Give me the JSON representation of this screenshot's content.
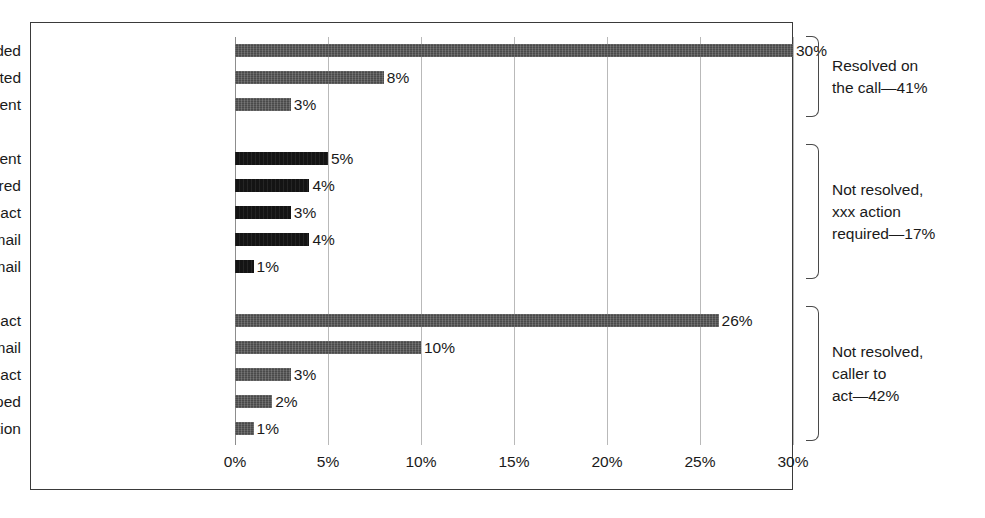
{
  "chart_data": {
    "type": "bar",
    "orientation": "horizontal",
    "title": "",
    "xlabel": "",
    "ylabel": "",
    "xlim": [
      0,
      30
    ],
    "grid": true,
    "legend": "none",
    "xticks": [
      "0%",
      "5%",
      "10%",
      "15%",
      "20%",
      "25%",
      "30%"
    ],
    "xtick_values": [
      0,
      5,
      10,
      15,
      20,
      25,
      30
    ],
    "categories": [
      "Information provided",
      "Process completed",
      "Statement sent",
      "Work request sent",
      "Call transferred",
      "XXX to act",
      "Form requested—mail",
      "Form requested—email",
      "Member to act",
      "Form sent—email",
      "Prospect to act",
      "Call dropped",
      "No clear action"
    ],
    "values": [
      30,
      8,
      3,
      5,
      4,
      3,
      4,
      1,
      26,
      10,
      3,
      2,
      1
    ],
    "value_labels": [
      "30%",
      "8%",
      "3%",
      "5%",
      "4%",
      "3%",
      "4%",
      "1%",
      "26%",
      "10%",
      "3%",
      "2%",
      "1%"
    ],
    "groups": [
      {
        "name": "Resolved on the call",
        "annotation": "Resolved on\nthe call—41%",
        "total": 41,
        "bar_color": "#4a4a4a",
        "categories": [
          "Information provided",
          "Process completed",
          "Statement sent"
        ],
        "values": [
          30,
          8,
          3
        ]
      },
      {
        "name": "Not resolved, xxx action required",
        "annotation": "Not resolved,\nxxx action\nrequired—17%",
        "total": 17,
        "bar_color": "#141414",
        "categories": [
          "Work request sent",
          "Call transferred",
          "XXX to act",
          "Form requested—mail",
          "Form requested—email"
        ],
        "values": [
          5,
          4,
          3,
          4,
          1
        ]
      },
      {
        "name": "Not resolved, caller to act",
        "annotation": "Not resolved,\ncaller to\nact—42%",
        "total": 42,
        "bar_color": "#4a4a4a",
        "categories": [
          "Member to act",
          "Form sent—email",
          "Prospect to act",
          "Call dropped",
          "No clear action"
        ],
        "values": [
          26,
          10,
          3,
          2,
          1
        ]
      }
    ]
  },
  "rows": [
    {
      "label": "Information provided",
      "value": 30,
      "value_label": "30%",
      "shade": "gray"
    },
    {
      "label": "Process completed",
      "value": 8,
      "value_label": "8%",
      "shade": "gray"
    },
    {
      "label": "Statement sent",
      "value": 3,
      "value_label": "3%",
      "shade": "gray"
    },
    {
      "label": "Work request sent",
      "value": 5,
      "value_label": "5%",
      "shade": "dark"
    },
    {
      "label": "Call transferred",
      "value": 4,
      "value_label": "4%",
      "shade": "dark"
    },
    {
      "label": "XXX to act",
      "value": 3,
      "value_label": "3%",
      "shade": "dark"
    },
    {
      "label": "Form requested—mail",
      "value": 4,
      "value_label": "4%",
      "shade": "dark"
    },
    {
      "label": "Form requested—email",
      "value": 1,
      "value_label": "1%",
      "shade": "dark"
    },
    {
      "label": "Member to act",
      "value": 26,
      "value_label": "26%",
      "shade": "gray"
    },
    {
      "label": "Form sent—email",
      "value": 10,
      "value_label": "10%",
      "shade": "gray"
    },
    {
      "label": "Prospect to act",
      "value": 3,
      "value_label": "3%",
      "shade": "gray"
    },
    {
      "label": "Call dropped",
      "value": 2,
      "value_label": "2%",
      "shade": "gray"
    },
    {
      "label": "No clear action",
      "value": 1,
      "value_label": "1%",
      "shade": "gray"
    }
  ],
  "brackets": [
    {
      "text": "Resolved on\nthe call—41%"
    },
    {
      "text": "Not resolved,\nxxx action\nrequired—17%"
    },
    {
      "text": "Not resolved,\ncaller to\nact—42%"
    }
  ]
}
